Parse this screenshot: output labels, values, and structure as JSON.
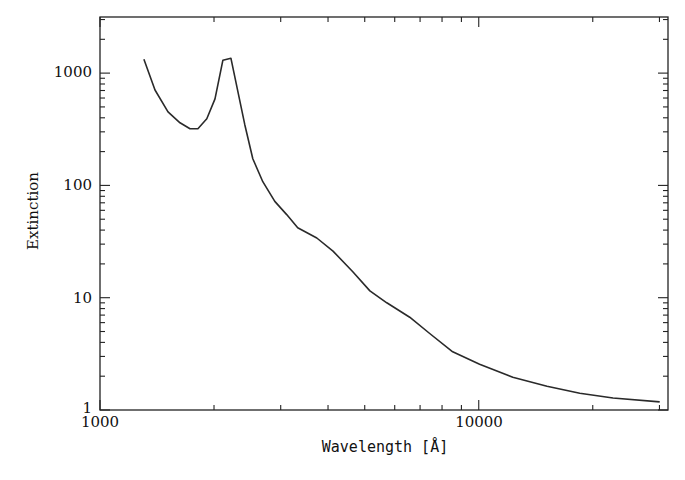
{
  "chart_data": {
    "type": "line",
    "title": "",
    "xlabel": "Wavelength [Å]",
    "ylabel": "Extinction",
    "xscale": "log",
    "yscale": "log",
    "xlim": [
      1000,
      31600
    ],
    "ylim": [
      1,
      3160
    ],
    "grid": false,
    "legend": null,
    "x_tick_labels": [
      "1000",
      "10000"
    ],
    "y_tick_labels": [
      "1",
      "10",
      "100",
      "1000"
    ],
    "series": [
      {
        "name": "Extinction curve",
        "x": [
          1306,
          1397,
          1512,
          1626,
          1728,
          1813,
          1914,
          2012,
          2111,
          2216,
          2411,
          2532,
          2691,
          2894,
          3111,
          3327,
          3737,
          4122,
          4650,
          5159,
          5717,
          6574,
          7420,
          8537,
          10054,
          12300,
          15140,
          18480,
          22620,
          30040
        ],
        "y": [
          1330,
          707,
          452,
          361,
          319,
          319,
          392,
          589,
          1303,
          1358,
          347,
          173,
          108,
          72,
          55,
          42,
          34,
          26,
          17,
          11.5,
          9.0,
          6.7,
          4.8,
          3.3,
          2.55,
          1.96,
          1.63,
          1.41,
          1.28,
          1.18
        ]
      }
    ]
  }
}
